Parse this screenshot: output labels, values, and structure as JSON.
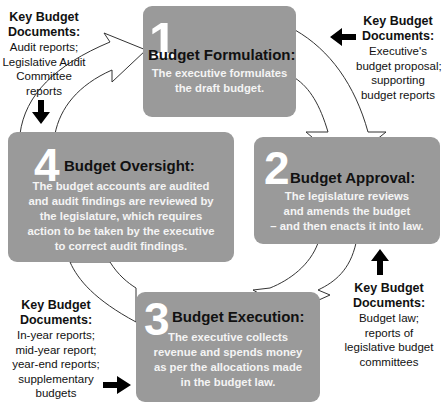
{
  "diagram": {
    "colors": {
      "box": "#9a9a9a",
      "box_text": "#ffffff",
      "title_text": "#111111",
      "arrow_fill": "#ffffff",
      "arrow_stroke": "#333333"
    },
    "stages": [
      {
        "number": "1",
        "title": "Budget Formulation:",
        "description": [
          "The executive formulates",
          "the draft budget."
        ]
      },
      {
        "number": "2",
        "title": "Budget Approval:",
        "description": [
          "The legislature reviews",
          "and amends the budget",
          "– and then enacts it into law."
        ]
      },
      {
        "number": "3",
        "title": "Budget Execution:",
        "description": [
          "The executive collects",
          "revenue and spends money",
          "as per the allocations made",
          "in the budget law."
        ]
      },
      {
        "number": "4",
        "title": "Budget Oversight:",
        "description": [
          "The budget accounts are audited",
          "and audit findings are reviewed by",
          "the legislature, which requires",
          "action to be taken by the executive",
          "to correct audit findings."
        ]
      }
    ],
    "key_documents": [
      {
        "stage": "4",
        "heading": [
          "Key Budget",
          "Documents:"
        ],
        "items": [
          "Audit reports;",
          "Legislative Audit",
          "Committee",
          "reports"
        ],
        "arrow": "arrow-down-icon"
      },
      {
        "stage": "1",
        "heading": [
          "Key Budget",
          "Documents:"
        ],
        "items": [
          "Executive's",
          "budget proposal;",
          "supporting",
          "budget reports"
        ],
        "arrow": "arrow-left-icon"
      },
      {
        "stage": "2",
        "heading": [
          "Key Budget",
          "Documents:"
        ],
        "items": [
          "Budget law;",
          "reports of",
          "legislative budget",
          "committees"
        ],
        "arrow": "arrow-up-icon"
      },
      {
        "stage": "3",
        "heading": [
          "Key Budget",
          "Documents:"
        ],
        "items": [
          "In-year reports;",
          "mid-year report;",
          "year-end reports;",
          "supplementary",
          "budgets"
        ],
        "arrow": "arrow-right-icon"
      }
    ]
  }
}
